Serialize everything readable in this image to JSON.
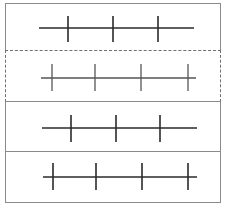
{
  "diagram": {
    "colors": {
      "border": "#8a8a8a",
      "dashed_border": "#6f6f6f",
      "line_dark": "#2a2a2a",
      "line_gray": "#555555",
      "background": "#ffffff"
    },
    "panels": [
      {
        "id": 1,
        "border_style": "solid",
        "top": 0,
        "height": 48,
        "line": {
          "x1": 33,
          "x2": 188,
          "y": 24
        },
        "tick_top": 12,
        "tick_bottom": 38,
        "ticks_x": [
          62,
          107,
          152
        ],
        "tick_count": 3,
        "stroke": "#2a2a2a"
      },
      {
        "id": 2,
        "border_style": "dashed",
        "top": 47,
        "height": 52,
        "line": {
          "x1": 35,
          "x2": 190,
          "y": 27
        },
        "tick_top": 13,
        "tick_bottom": 40,
        "ticks_x": [
          46,
          89,
          135,
          182
        ],
        "tick_count": 4,
        "stroke": "#555555"
      },
      {
        "id": 3,
        "border_style": "solid",
        "top": 98,
        "height": 51,
        "line": {
          "x1": 36,
          "x2": 191,
          "y": 26
        },
        "tick_top": 13,
        "tick_bottom": 40,
        "ticks_x": [
          65,
          110,
          154
        ],
        "tick_count": 3,
        "stroke": "#2a2a2a"
      },
      {
        "id": 4,
        "border_style": "solid",
        "top": 148,
        "height": 52,
        "line": {
          "x1": 37,
          "x2": 191,
          "y": 25
        },
        "tick_top": 11,
        "tick_bottom": 38,
        "ticks_x": [
          47,
          90,
          136,
          182
        ],
        "tick_count": 4,
        "stroke": "#2a2a2a"
      }
    ]
  }
}
